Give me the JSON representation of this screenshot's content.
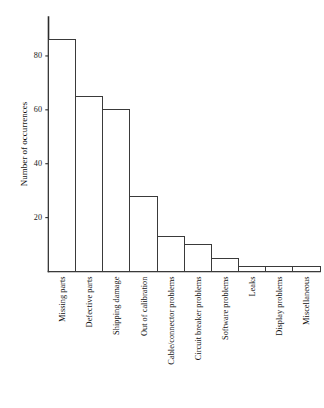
{
  "chart_data": {
    "type": "bar",
    "title": "",
    "subtitle": "",
    "xlabel": "",
    "ylabel": "Number of occurrences",
    "ylim": [
      0,
      90
    ],
    "yticks": [
      20,
      40,
      60,
      80
    ],
    "ytick_labels": [
      "20",
      "40",
      "60",
      "80"
    ],
    "grid": false,
    "legend": false,
    "legend_position": "none",
    "orientation": "vertical",
    "bar_fill_color": "#ffffff",
    "bar_edge_color": "#3a3a3a",
    "axis_color": "#2b2b2b",
    "xtick_label_rotation": 90,
    "categories": [
      "Missing parts",
      "Defective parts",
      "Shipping damage",
      "Out of calibration",
      "Cable/connector problems",
      "Circuit breaker problems",
      "Software problems",
      "Leaks",
      "Display problems",
      "Miscellaneous"
    ],
    "values": [
      86,
      65,
      60,
      28,
      13,
      10,
      5,
      2,
      2,
      2
    ]
  }
}
